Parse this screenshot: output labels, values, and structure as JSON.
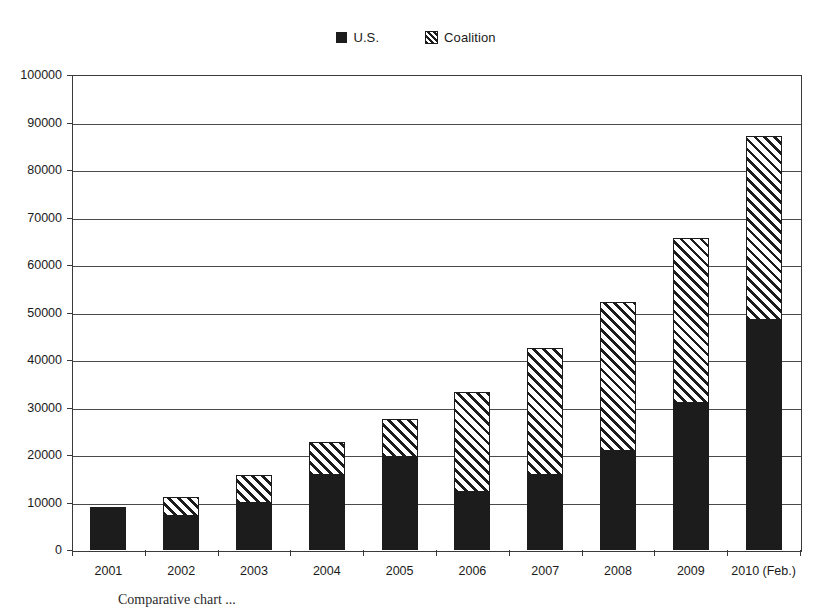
{
  "chart_data": {
    "type": "bar",
    "subtype": "stacked-vertical",
    "title": "",
    "xlabel": "",
    "ylabel": "",
    "ylim": [
      0,
      100000
    ],
    "ytick_step": 10000,
    "yticks": [
      0,
      10000,
      20000,
      30000,
      40000,
      50000,
      60000,
      70000,
      80000,
      90000,
      100000
    ],
    "ytick_labels": [
      "0",
      "10000",
      "20000",
      "30000",
      "40000",
      "50000",
      "60000",
      "70000",
      "80000",
      "90000",
      "100000"
    ],
    "grid": true,
    "grid_axis": "y",
    "legend_position": "top-center",
    "categories": [
      "2001",
      "2002",
      "2003",
      "2004",
      "2005",
      "2006",
      "2007",
      "2008",
      "2009",
      "2010 (Feb.)"
    ],
    "series": [
      {
        "name": "U.S.",
        "pattern": "solid",
        "color": "#1c1c1c",
        "values": [
          9000,
          7200,
          9900,
          15800,
          19600,
          12200,
          15800,
          20800,
          31000,
          48400
        ]
      },
      {
        "name": "Coalition",
        "pattern": "diagonal-hatch",
        "color": "#1c1c1c",
        "values": [
          0,
          4000,
          5900,
          6900,
          8000,
          21100,
          26700,
          31400,
          34700,
          38700
        ]
      }
    ],
    "totals": [
      9000,
      11200,
      15800,
      22700,
      27600,
      33300,
      42500,
      52200,
      65700,
      87100
    ]
  },
  "legend": {
    "entries": [
      {
        "label": "U.S.",
        "swatch": "solid-square-icon"
      },
      {
        "label": "Coalition",
        "swatch": "hatched-square-icon"
      }
    ]
  },
  "caption": {
    "text": "Comparative chart ..."
  }
}
